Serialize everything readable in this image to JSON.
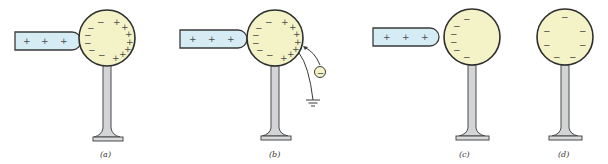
{
  "figure": {
    "panels": [
      {
        "id": "a",
        "label": "(a)",
        "has_rod": true,
        "rod_charges": [
          "+",
          "+",
          "+"
        ],
        "sphere_left_charges": [
          "−",
          "−",
          "−",
          "−",
          "−",
          "−"
        ],
        "sphere_right_charges": [
          "+",
          "+",
          "+",
          "+",
          "+",
          "+",
          "+"
        ],
        "grounded": false
      },
      {
        "id": "b",
        "label": "(b)",
        "has_rod": true,
        "rod_charges": [
          "+",
          "+",
          "+"
        ],
        "sphere_left_charges": [
          "−",
          "−",
          "−",
          "−",
          "−",
          "−"
        ],
        "sphere_right_charges": [
          "+",
          "+",
          "+",
          "+",
          "+",
          "+",
          "+"
        ],
        "grounded": true,
        "electron_symbol": "−"
      },
      {
        "id": "c",
        "label": "(c)",
        "has_rod": true,
        "rod_charges": [
          "+",
          "+",
          "+"
        ],
        "sphere_left_charges": [
          "−",
          "−",
          "−",
          "−",
          "−",
          "−"
        ],
        "sphere_right_charges": [],
        "grounded": false
      },
      {
        "id": "d",
        "label": "(d)",
        "has_rod": false,
        "rod_charges": [],
        "sphere_distributed_charges": [
          "−",
          "−",
          "−",
          "−",
          "−",
          "−",
          "−"
        ],
        "grounded": false
      }
    ],
    "colors": {
      "rod_fill": "#d6ecf5",
      "sphere_fill": "#f4f3c8",
      "stand_fill": "#d2d4d6",
      "outline": "#2e2e2e"
    }
  }
}
